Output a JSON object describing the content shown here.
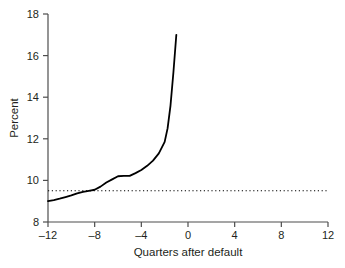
{
  "chart_data": {
    "type": "line",
    "title": "",
    "subtitle": "",
    "xlabel": "Quarters after default",
    "ylabel": "Percent",
    "xlim": [
      -12,
      12
    ],
    "ylim": [
      8,
      18
    ],
    "xticks": [
      -12,
      -8,
      -4,
      0,
      4,
      8,
      12
    ],
    "xticklabels": [
      "–12",
      "–8",
      "–4",
      "0",
      "4",
      "8",
      "12"
    ],
    "yticks": [
      8,
      10,
      12,
      14,
      16,
      18
    ],
    "yticklabels": [
      "8",
      "10",
      "12",
      "14",
      "16",
      "18"
    ],
    "grid": false,
    "legend": null,
    "legend_position": "none",
    "series": [
      {
        "name": "Percent",
        "style": "solid",
        "color": "#000000",
        "linewidth": 1.8,
        "x": [
          -12,
          -11.5,
          -11,
          -10.5,
          -10,
          -9.5,
          -9,
          -8.5,
          -8,
          -7.5,
          -7,
          -6.5,
          -6,
          -5.5,
          -5,
          -4.5,
          -4,
          -3.5,
          -3,
          -2.5,
          -2,
          -1.75,
          -1.5,
          -1.25,
          -1
        ],
        "y": [
          9.0,
          9.05,
          9.12,
          9.2,
          9.28,
          9.38,
          9.45,
          9.5,
          9.55,
          9.7,
          9.9,
          10.05,
          10.2,
          10.22,
          10.22,
          10.35,
          10.5,
          10.7,
          10.95,
          11.3,
          11.85,
          12.5,
          13.6,
          15.2,
          17.0
        ]
      },
      {
        "name": "Reference line",
        "style": "dotted",
        "color": "#000000",
        "linewidth": 1.1,
        "x": [
          -12,
          12
        ],
        "y": [
          9.5,
          9.5
        ]
      }
    ],
    "reference_line_value": 9.5,
    "annotations": []
  },
  "axes": {
    "x_axis_label": "Quarters after default",
    "y_axis_label": "Percent",
    "spines": {
      "left": true,
      "bottom": true,
      "top": false,
      "right": false
    }
  },
  "colors": {
    "background": "#ffffff",
    "ink": "#231f20",
    "line": "#000000",
    "axis": "#4d4d4d"
  }
}
